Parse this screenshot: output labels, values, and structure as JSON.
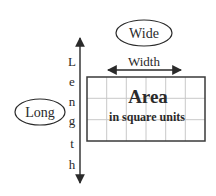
{
  "diagram": {
    "wide_bubble": {
      "label": "Wide"
    },
    "long_bubble": {
      "label": "Long"
    },
    "width_arrow": {
      "label": "Width"
    },
    "length_arrow": {
      "letters": [
        "L",
        "e",
        "n",
        "g",
        "t",
        "h"
      ]
    },
    "area_box": {
      "title": "Area",
      "subtitle": "in square units",
      "columns": 6,
      "rows": 3
    },
    "colors": {
      "ink": "#2a2a2a",
      "grid": "#c8c8c8",
      "background": "#ffffff"
    }
  }
}
